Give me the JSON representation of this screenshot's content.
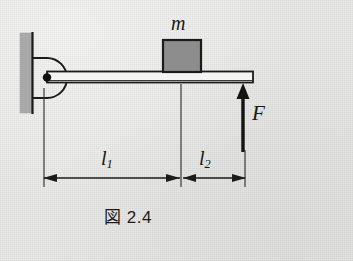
{
  "figure": {
    "caption": "図 2.4",
    "background_color": "#eaeae8",
    "ink_color": "#1b1b1b",
    "labels": {
      "mass": "m",
      "force": "F",
      "length_1_base": "l",
      "length_1_sub": "1",
      "length_2_base": "l",
      "length_2_sub": "2"
    },
    "elements": {
      "wall": {
        "name": "wall-hatching",
        "fill_color": "#a9a9a9",
        "x": 20,
        "y": 33,
        "width": 12,
        "height": 80
      },
      "pivot_bracket": {
        "name": "pivot-bracket",
        "description": "semicircular hinge bracket attached to wall"
      },
      "pivot_point": {
        "name": "pivot-point",
        "description": "black filled circle marking the fulcrum",
        "cx": 47,
        "cy": 78
      },
      "beam": {
        "name": "horizontal-beam",
        "fill_color": "#f2f2f0",
        "x": 47,
        "y": 72,
        "width": 206,
        "height": 11
      },
      "block": {
        "name": "mass-block",
        "fill_color": "#8d8d8d",
        "x": 163,
        "y": 40,
        "width": 38,
        "height": 33
      },
      "force_arrow": {
        "name": "force-arrow-F",
        "direction": "up",
        "x": 243,
        "y_tip": 84,
        "y_tail": 152
      }
    },
    "dimensions": {
      "baseline_y": 178,
      "left_extension_x": 44,
      "middle_extension_x": 181,
      "right_extension_x": 245,
      "l1_span": "from pivot to mass-block center",
      "l2_span": "from mass-block center to force arrow"
    }
  }
}
